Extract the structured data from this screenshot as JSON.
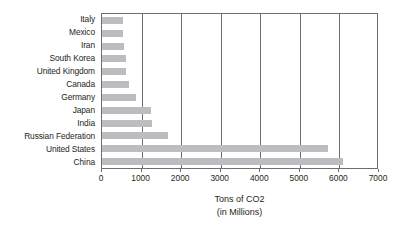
{
  "chart_data": {
    "type": "bar",
    "orientation": "horizontal",
    "title": "",
    "xlabel": "Tons of CO2 (in Millions)",
    "ylabel": "",
    "categories": [
      "Italy",
      "Mexico",
      "Iran",
      "South Korea",
      "United Kingdom",
      "Canada",
      "Germany",
      "Japan",
      "India",
      "Russian Federation",
      "United States",
      "China"
    ],
    "values": [
      520,
      530,
      560,
      600,
      610,
      690,
      860,
      1240,
      1270,
      1660,
      5700,
      6100
    ],
    "xlim": [
      0,
      7000
    ],
    "xticks": [
      0,
      1000,
      2000,
      3000,
      4000,
      5000,
      6000,
      7000
    ],
    "xtick_labels": [
      "0",
      "1000",
      "2000",
      "3000",
      "4000",
      "5000",
      "6000",
      "7000"
    ],
    "grid": "vertical",
    "legend": null,
    "bar_color": "#bcbdc0",
    "axis_color": "#6d6e71",
    "text_color": "#231f20",
    "background": "#ffffff"
  },
  "axis_title": {
    "line1": "Tons of CO2",
    "line2": "(in Millions)"
  }
}
